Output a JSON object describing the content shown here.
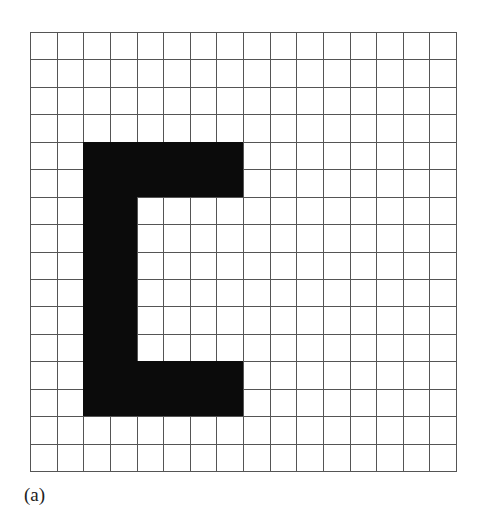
{
  "figure": {
    "label": "(a)",
    "grid": {
      "rows": 16,
      "cols": 16,
      "line_color": "#555555",
      "fill_color": "#0b0b0b",
      "background": "#ffffff"
    },
    "filled_regions": [
      {
        "name": "top-bar",
        "rows": [
          4,
          5
        ],
        "cols": [
          2,
          7
        ]
      },
      {
        "name": "stem",
        "rows": [
          4,
          13
        ],
        "cols": [
          2,
          3
        ]
      },
      {
        "name": "bottom-bar",
        "rows": [
          12,
          13
        ],
        "cols": [
          2,
          7
        ]
      }
    ]
  }
}
